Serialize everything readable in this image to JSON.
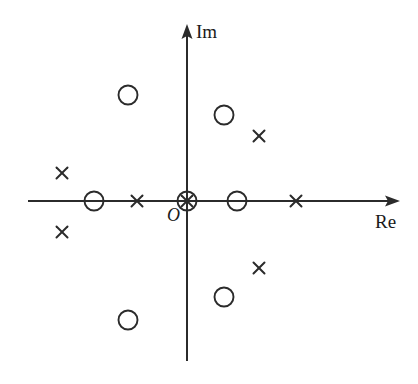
{
  "figure": {
    "title": "",
    "kind": "pole-zero-plot",
    "background": "#ffffff",
    "stroke_color": "#2b2b2b",
    "width": 418,
    "height": 384
  },
  "axes": {
    "real": {
      "label": "Re",
      "label_x": 375,
      "label_y": 212,
      "y": 201,
      "x_start": 28,
      "x_end": 400,
      "arrow": "right"
    },
    "imag": {
      "label": "Im",
      "label_x": 196,
      "label_y": 22,
      "x": 187,
      "y_start": 361,
      "y_end": 24,
      "arrow": "up"
    },
    "origin": {
      "label": "O",
      "label_x": 167,
      "label_y": 206,
      "x": 187,
      "y": 201
    }
  },
  "chart_data": {
    "type": "scatter",
    "title": "",
    "xlabel": "Re",
    "ylabel": "Im",
    "grid": false,
    "legend": "none",
    "axis_units": "unlabeled",
    "xlim": [
      -4.4,
      5.3
    ],
    "ylim": [
      -2.6,
      2.6
    ],
    "series": [
      {
        "name": "poles",
        "marker": "x",
        "marker_symbol": "×",
        "count": 8,
        "points_px": [
          {
            "x": 62,
            "y": 173
          },
          {
            "x": 62,
            "y": 232
          },
          {
            "x": 137,
            "y": 201
          },
          {
            "x": 187,
            "y": 201
          },
          {
            "x": 259,
            "y": 136
          },
          {
            "x": 259,
            "y": 268
          },
          {
            "x": 296,
            "y": 201
          }
        ],
        "points_data": [
          {
            "re": -3.25,
            "im": 0.75
          },
          {
            "re": -3.25,
            "im": -0.79
          },
          {
            "re": -1.3,
            "im": 0.0
          },
          {
            "re": 0.0,
            "im": 0.0
          },
          {
            "re": 1.87,
            "im": 1.69
          },
          {
            "re": 1.87,
            "im": -1.74
          },
          {
            "re": 2.84,
            "im": 0.0
          }
        ]
      },
      {
        "name": "zeros",
        "marker": "o",
        "marker_symbol": "○",
        "count": 6,
        "points_px": [
          {
            "x": 128,
            "y": 95
          },
          {
            "x": 94,
            "y": 201
          },
          {
            "x": 128,
            "y": 320
          },
          {
            "x": 187,
            "y": 201
          },
          {
            "x": 224,
            "y": 115
          },
          {
            "x": 237,
            "y": 201
          },
          {
            "x": 224,
            "y": 297
          }
        ],
        "points_data": [
          {
            "re": -1.53,
            "im": 2.75
          },
          {
            "re": -2.42,
            "im": 0.0
          },
          {
            "re": -1.53,
            "im": -3.09
          },
          {
            "re": 0.0,
            "im": 0.0
          },
          {
            "re": 0.96,
            "im": 2.23
          },
          {
            "re": 1.3,
            "im": 0.0
          },
          {
            "re": 0.96,
            "im": -2.49
          }
        ]
      }
    ],
    "annotations": [
      {
        "text": "Im",
        "x": 196,
        "y": 22
      },
      {
        "text": "Re",
        "x": 375,
        "y": 212
      },
      {
        "text": "O",
        "x": 167,
        "y": 206
      }
    ]
  },
  "markers": {
    "x_size": 11,
    "o_radius": 9.5,
    "x_stroke_width": 2.0,
    "o_stroke_width": 1.9
  }
}
